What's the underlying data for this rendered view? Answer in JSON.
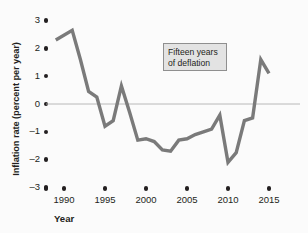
{
  "figure": {
    "background_color": "#fbfbfb",
    "line_color": "#7a7a7a",
    "text_color": "#231f20",
    "zero_line_color": "#b0b0b0",
    "annotation_fill": "#e3e3e3",
    "annotation_border": "#8f8f8f"
  },
  "annotation": {
    "line1": "Fifteen years",
    "line2": "of deflation"
  },
  "axis": {
    "y_title": "Inflation rate (percent per year)",
    "x_title": "Year",
    "y_ticks": [
      "3",
      "2",
      "1",
      "0",
      "–1",
      "–2",
      "–3"
    ],
    "x_ticks": [
      "1990",
      "1995",
      "2000",
      "2005",
      "2010",
      "2015"
    ]
  },
  "chart_data": {
    "type": "line",
    "title": "",
    "xlabel": "Year",
    "ylabel": "Inflation rate (percent per year)",
    "xlim": [
      1989,
      2015.5
    ],
    "ylim": [
      -3,
      3
    ],
    "grid": false,
    "legend": null,
    "zero_reference_line": 0,
    "annotations": [
      {
        "text": "Fifteen years of deflation",
        "x": 2002.5,
        "y": 2.0,
        "style": "boxed"
      }
    ],
    "x": [
      1989,
      1991,
      1992,
      1993,
      1994,
      1995,
      1996,
      1997,
      1998,
      1999,
      2000,
      2001,
      2002,
      2003,
      2004,
      2005,
      2006,
      2007,
      2008,
      2009,
      2010,
      2011,
      2012,
      2013,
      2014,
      2015
    ],
    "series": [
      {
        "name": "Inflation rate",
        "values": [
          2.3,
          2.65,
          1.6,
          0.45,
          0.25,
          -0.8,
          -0.6,
          0.65,
          -0.3,
          -1.3,
          -1.25,
          -1.35,
          -1.65,
          -1.7,
          -1.3,
          -1.25,
          -1.1,
          -1.0,
          -0.9,
          -0.4,
          -2.1,
          -1.75,
          -0.6,
          -0.5,
          1.6,
          1.1
        ]
      }
    ],
    "y_tick_values": [
      3,
      2,
      1,
      0,
      -1,
      -2,
      -3
    ],
    "x_tick_values": [
      1990,
      1995,
      2000,
      2005,
      2010,
      2015
    ]
  }
}
